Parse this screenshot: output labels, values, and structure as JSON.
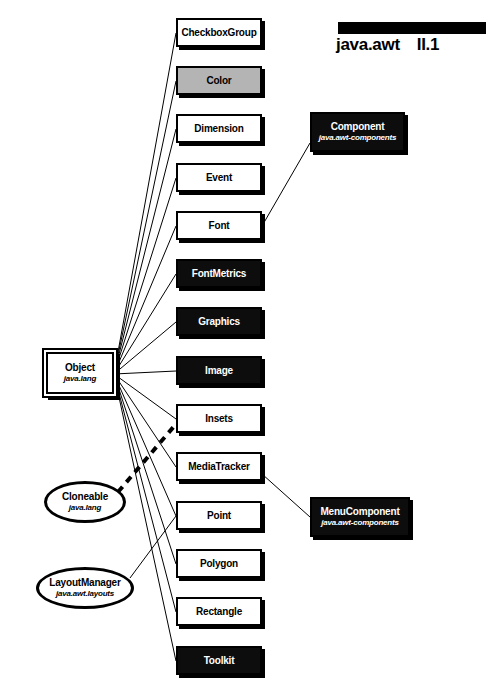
{
  "header": {
    "package": "java.awt",
    "section": "II.1"
  },
  "colors": {
    "line": "#000000",
    "abstract_fill": "#0d0d0d",
    "highlight_fill": "#b4b4b4",
    "plain_fill": "#ffffff"
  },
  "diagram": {
    "title": "java.awt",
    "root": {
      "name": "Object",
      "package": "java.lang",
      "shape": "double-box",
      "x": 46,
      "y": 352,
      "w": 68,
      "h": 42
    },
    "interfaces": [
      {
        "name": "Cloneable",
        "package": "java.lang",
        "shape": "ellipse",
        "x": 44,
        "y": 481,
        "w": 82,
        "h": 42
      },
      {
        "name": "LayoutManager",
        "package": "java.awt.layouts",
        "shape": "ellipse",
        "x": 36,
        "y": 567,
        "w": 98,
        "h": 42
      }
    ],
    "classes": [
      {
        "name": "CheckboxGroup",
        "fill": "white",
        "x": 176,
        "y": 18,
        "w": 86,
        "h": 29
      },
      {
        "name": "Color",
        "fill": "gray",
        "x": 176,
        "y": 66,
        "w": 86,
        "h": 29
      },
      {
        "name": "Dimension",
        "fill": "white",
        "x": 176,
        "y": 114,
        "w": 86,
        "h": 29
      },
      {
        "name": "Event",
        "fill": "white",
        "x": 176,
        "y": 163,
        "w": 86,
        "h": 29
      },
      {
        "name": "Font",
        "fill": "white",
        "x": 176,
        "y": 211,
        "w": 86,
        "h": 29
      },
      {
        "name": "FontMetrics",
        "fill": "black",
        "x": 176,
        "y": 259,
        "w": 86,
        "h": 29
      },
      {
        "name": "Graphics",
        "fill": "black",
        "x": 176,
        "y": 307,
        "w": 86,
        "h": 29
      },
      {
        "name": "Image",
        "fill": "black",
        "x": 176,
        "y": 356,
        "w": 86,
        "h": 29
      },
      {
        "name": "Insets",
        "fill": "white",
        "x": 176,
        "y": 404,
        "w": 86,
        "h": 29
      },
      {
        "name": "MediaTracker",
        "fill": "white",
        "x": 176,
        "y": 452,
        "w": 86,
        "h": 29
      },
      {
        "name": "Point",
        "fill": "white",
        "x": 176,
        "y": 501,
        "w": 86,
        "h": 29
      },
      {
        "name": "Polygon",
        "fill": "white",
        "x": 176,
        "y": 549,
        "w": 86,
        "h": 29
      },
      {
        "name": "Rectangle",
        "fill": "white",
        "x": 176,
        "y": 597,
        "w": 86,
        "h": 29
      },
      {
        "name": "Toolkit",
        "fill": "black",
        "x": 176,
        "y": 646,
        "w": 86,
        "h": 29
      }
    ],
    "packages": [
      {
        "name": "Component",
        "package": "java.awt-components",
        "fill": "black",
        "x": 310,
        "y": 112,
        "w": 95,
        "h": 40
      },
      {
        "name": "MenuComponent",
        "package": "java.awt-components",
        "fill": "black",
        "x": 310,
        "y": 497,
        "w": 100,
        "h": 40
      }
    ]
  }
}
